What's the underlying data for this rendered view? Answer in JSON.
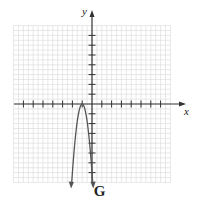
{
  "figure": {
    "label": "G",
    "x_axis_label": "x",
    "y_axis_label": "y"
  },
  "chart_data": {
    "type": "line",
    "title": "G",
    "xlabel": "x",
    "ylabel": "y",
    "xlim": [
      -8,
      8
    ],
    "ylim": [
      -8,
      8
    ],
    "grid": true,
    "vertex": [
      -1,
      0
    ],
    "series": [
      {
        "name": "curve",
        "x": [
          -2.1,
          -2,
          -1.75,
          -1.5,
          -1.25,
          -1,
          -0.75,
          -0.5,
          -0.25,
          0,
          0.1
        ],
        "y": [
          -8.5,
          -7,
          -3.9,
          -1.75,
          -0.44,
          0,
          -0.44,
          -1.75,
          -3.9,
          -7,
          -8.5
        ]
      }
    ]
  },
  "colors": {
    "grid": "#d9d9d9",
    "axis": "#333333",
    "curve": "#555555"
  }
}
